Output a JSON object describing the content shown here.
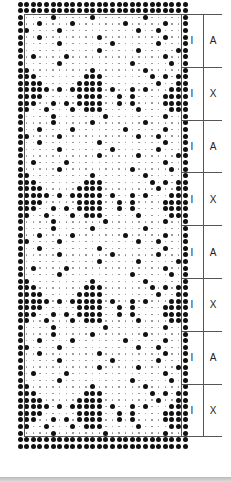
{
  "diagram": {
    "type": "knitting-chart",
    "grid": {
      "columns": 26,
      "col_start_x": 20,
      "col_pitch": 6.6,
      "row_start_y": 4,
      "row_pitch": 6.6
    },
    "border_rows_top": 2,
    "border_rows_bottom": 2,
    "band_rows": 8,
    "bands": [
      {
        "label_left": "I",
        "label_right": "A",
        "pattern": "A"
      },
      {
        "label_left": "I",
        "label_right": "X",
        "pattern": "X"
      },
      {
        "label_left": "I",
        "label_right": "A",
        "pattern": "A"
      },
      {
        "label_left": "I",
        "label_right": "X",
        "pattern": "X"
      },
      {
        "label_left": "I",
        "label_right": "A",
        "pattern": "A"
      },
      {
        "label_left": "I",
        "label_right": "X",
        "pattern": "X"
      },
      {
        "label_left": "I",
        "label_right": "A",
        "pattern": "A"
      },
      {
        "label_left": "I",
        "label_right": "X",
        "pattern": "X"
      }
    ],
    "patterns": {
      "A": [
        "#....#.....#.......#.....#",
        "#..#....#.......#.....#..#",
        "##....#...........#..#...#",
        "#..#........#.........#..#",
        "#.....#.......#......#...#",
        "#...........#.....#.....##",
        "#.#....#..............#..#",
        "#.....#..........#.....#.#"
      ],
      "X": [
        "##.........#.......#.....#",
        "###.......###.......#.#.##",
        "####.....####........#..##",
        "#####.#.#####.#..#.#...###",
        "####.....####..#.#....####",
        "###..#.#.####..#.#....####",
        "##..#...#.###.....#....###",
        "#....#.......#........#..#"
      ]
    },
    "label_lines": {
      "v_left_x": 24,
      "v_right_x": 181,
      "v_label_x": 203,
      "h_end_x": 222
    }
  }
}
